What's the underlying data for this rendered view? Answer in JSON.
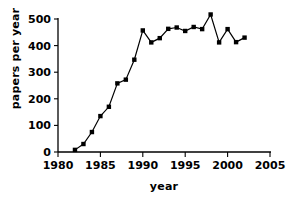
{
  "chart_data": {
    "type": "line",
    "title": "",
    "xlabel": "year",
    "ylabel": "papers per year",
    "xlim": [
      1980,
      2005
    ],
    "ylim": [
      0,
      520
    ],
    "xticks": [
      1980,
      1985,
      1990,
      1995,
      2000,
      2005
    ],
    "yticks": [
      0,
      100,
      200,
      300,
      400,
      500
    ],
    "xtick_labels": [
      "1980",
      "1985",
      "1990",
      "1995",
      "2000",
      "2005"
    ],
    "ytick_labels": [
      "0",
      "100",
      "200",
      "300",
      "400",
      "500"
    ],
    "grid": false,
    "legend": false,
    "marker": "square",
    "marker_color": "#000000",
    "line_color": "#000000",
    "series": [
      {
        "name": "papers per year",
        "x": [
          1982,
          1983,
          1984,
          1985,
          1986,
          1987,
          1988,
          1989,
          1990,
          1991,
          1992,
          1993,
          1994,
          1995,
          1996,
          1997,
          1998,
          1999,
          2000,
          2001,
          2002
        ],
        "values": [
          8,
          30,
          75,
          135,
          170,
          258,
          272,
          347,
          457,
          412,
          428,
          463,
          468,
          455,
          470,
          462,
          517,
          412,
          462,
          413,
          430
        ]
      }
    ]
  }
}
